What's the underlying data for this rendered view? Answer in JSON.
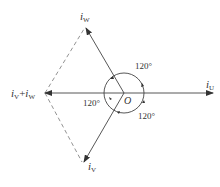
{
  "diagram": {
    "type": "phasor-diagram",
    "origin_label": "O",
    "vectors": [
      {
        "id": "iU",
        "label_main": "i",
        "label_sub": "U"
      },
      {
        "id": "iW",
        "label_main": "i",
        "label_sub": "W"
      },
      {
        "id": "iV",
        "label_main": "i",
        "label_sub": "V"
      },
      {
        "id": "sum",
        "label_main1": "i",
        "label_sub1": "V",
        "plus": "+",
        "label_main2": "i",
        "label_sub2": "W"
      }
    ],
    "angles": [
      {
        "position": "upper-right",
        "text": "120°"
      },
      {
        "position": "left",
        "text": "120°"
      },
      {
        "position": "lower-right",
        "text": "120°"
      }
    ],
    "colors": {
      "line": "#444444",
      "dashed": "#777777",
      "text": "#333333"
    }
  }
}
